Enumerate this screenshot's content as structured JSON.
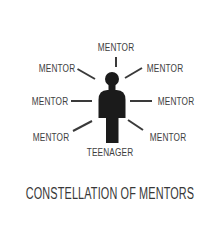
{
  "title": "CONSTELLATION OF MENTORS",
  "diagram": {
    "center_label": "TEENAGER",
    "mentors": [
      {
        "position": "top",
        "label": "MENTOR"
      },
      {
        "position": "upper-left",
        "label": "MENTOR"
      },
      {
        "position": "upper-right",
        "label": "MENTOR"
      },
      {
        "position": "left",
        "label": "MENTOR"
      },
      {
        "position": "right",
        "label": "MENTOR"
      },
      {
        "position": "lower-left",
        "label": "MENTOR"
      },
      {
        "position": "lower-right",
        "label": "MENTOR"
      }
    ]
  },
  "colors": {
    "background": "#ffffff",
    "figure": "#1b1b1b",
    "line": "#3a3a3a",
    "text": "#3e3e3e"
  }
}
